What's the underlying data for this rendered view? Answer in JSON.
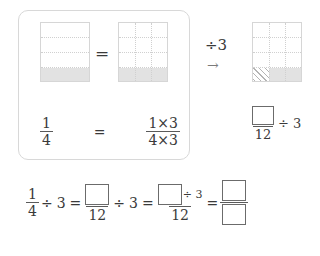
{
  "page": {
    "background_color": "#ffffff",
    "ink_color": "#3a3a3a",
    "shade_color": "#e2e2e2",
    "grid_line_color": "#d0d0d0",
    "box_border_color": "#6b6b6b"
  },
  "panel": {
    "equals_sign": "=",
    "left_model": {
      "name": "one-fourth-bar",
      "rows": 4,
      "columns": 1,
      "shaded_cells": 1,
      "shaded_position": "bottom row",
      "fraction_shown": "1/4"
    },
    "right_model": {
      "name": "three-twelfths-bar",
      "rows": 4,
      "columns": 3,
      "shaded_cells": 3,
      "shaded_position": "bottom row",
      "fraction_shown": "3/12"
    },
    "equation": {
      "left_numerator": "1",
      "left_denominator": "4",
      "equals": "=",
      "right_numerator": "1×3",
      "right_denominator": "4×3"
    }
  },
  "divide_step": {
    "label": "÷3",
    "arrow": "→"
  },
  "result_model": {
    "name": "divided-bar",
    "rows": 4,
    "columns": 3,
    "shaded_cells": 3,
    "shaded_position": "bottom row",
    "hatched_cells": 1,
    "hatched_position": "bottom-left cell"
  },
  "result_expression": {
    "numerator_box": "",
    "denominator": "12",
    "operator": "÷ 3"
  },
  "bottom_equation": {
    "terms": [
      {
        "kind": "fraction",
        "numerator": "1",
        "denominator": "4"
      },
      {
        "kind": "operator",
        "text": "÷"
      },
      {
        "kind": "number",
        "text": "3"
      },
      {
        "kind": "operator",
        "text": "="
      },
      {
        "kind": "fraction_box_over_number",
        "numerator": "",
        "denominator": "12"
      },
      {
        "kind": "operator",
        "text": "÷"
      },
      {
        "kind": "number",
        "text": "3"
      },
      {
        "kind": "operator",
        "text": "="
      },
      {
        "kind": "fraction_boxdiv_over_number",
        "numerator_box": "",
        "numerator_op": "÷ 3",
        "denominator": "12"
      },
      {
        "kind": "operator",
        "text": "="
      },
      {
        "kind": "fraction_box_over_box",
        "numerator": "",
        "denominator": ""
      }
    ],
    "readable": "1/4 ÷ 3 = □/12 ÷ 3 = (□÷3)/12 = □/□"
  }
}
